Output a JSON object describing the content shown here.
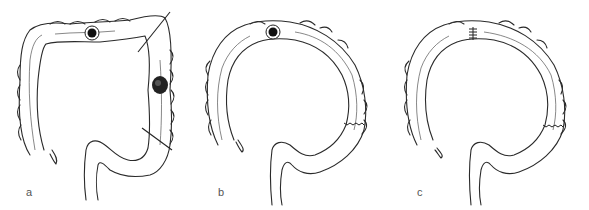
{
  "figure": {
    "panels": [
      {
        "id": "a",
        "label": "a",
        "features": [
          "stoma",
          "tumor",
          "resection-line-upper",
          "resection-line-lower"
        ]
      },
      {
        "id": "b",
        "label": "b",
        "features": [
          "stoma",
          "anastomosis"
        ]
      },
      {
        "id": "c",
        "label": "c",
        "features": [
          "closed-stoma-sutures",
          "anastomosis"
        ]
      }
    ]
  },
  "colors": {
    "line": "#2a2a2a",
    "fill": "#ffffff",
    "tumor": "#222222",
    "label": "#555555"
  }
}
